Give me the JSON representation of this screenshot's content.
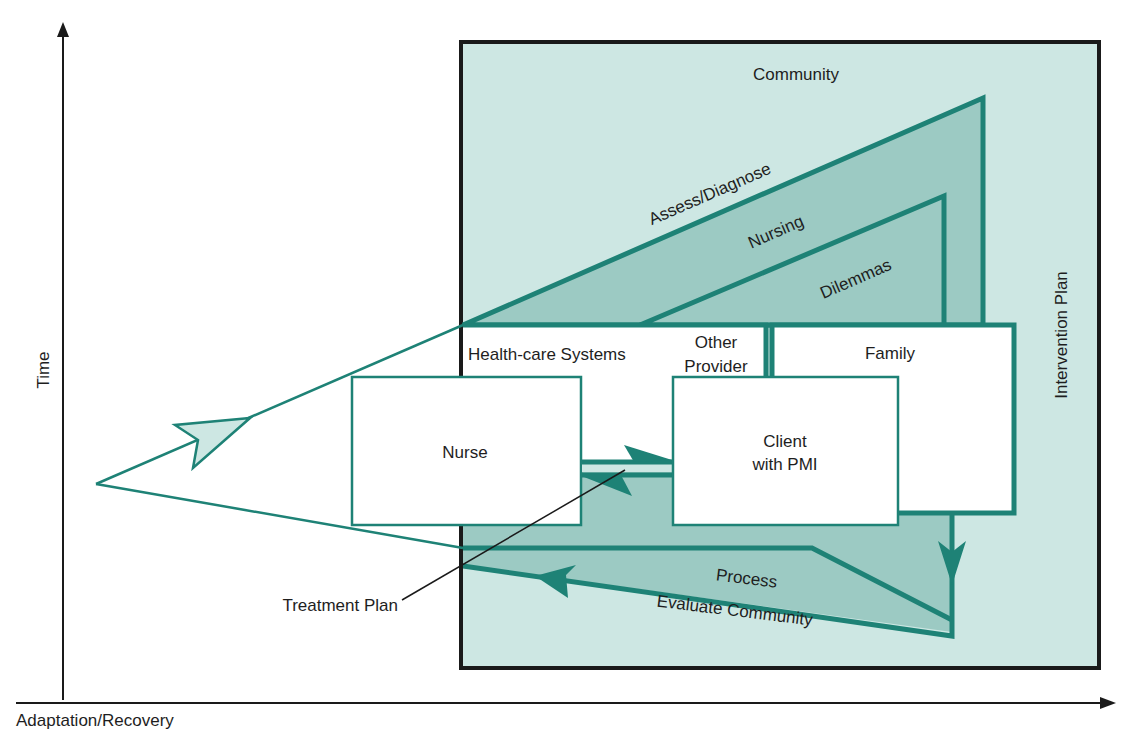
{
  "colors": {
    "teal": "#1e8276",
    "light_bg": "#cde7e3",
    "mid_fill": "#9ccac3",
    "box_fill": "#ffffff",
    "axis": "#1a1a1a"
  },
  "axes": {
    "y_label": "Time",
    "x_label": "Adaptation/Recovery"
  },
  "frame": {
    "title": "Community",
    "right_label": "Intervention Plan"
  },
  "triangle": {
    "outer_label": "Assess/Diagnose",
    "middle_label": "Nursing",
    "inner_label": "Dilemmas"
  },
  "boxes": {
    "health_care": "Health-care Systems",
    "other_provider_line1": "Other",
    "other_provider_line2": "Provider",
    "family": "Family",
    "nurse": "Nurse",
    "client_line1": "Client",
    "client_line2": "with PMI"
  },
  "bottom": {
    "process_label": "Process",
    "evaluate_label": "Evaluate Community"
  },
  "callout": {
    "treatment_plan": "Treatment Plan"
  }
}
